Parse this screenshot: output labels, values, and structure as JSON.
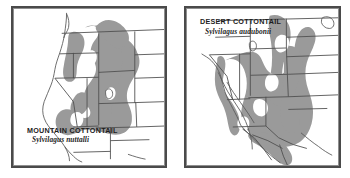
{
  "figure": {
    "background_color": "#ffffff",
    "frame_color": "#4a4a4a",
    "range_shading_color": "#9a9a9a",
    "boundary_line_color": "#4f4f4f",
    "coastline_color": "#6b6b6b"
  },
  "panels": [
    {
      "id": "mountain-cottontail",
      "common_name": "MOUNTAIN COTTONTAIL",
      "scientific_name": "Sylvilagus nuttalli",
      "label_position": "bottom-left",
      "region": "Western United States, Great Basin and Rocky Mountains",
      "range_shading_color": "#9a9a9a"
    },
    {
      "id": "desert-cottontail",
      "common_name": "DESERT COTTONTAIL",
      "scientific_name": "Sylvilagus audubonii",
      "label_position": "top-left",
      "region": "Southwestern United States and northern Mexico",
      "range_shading_color": "#9a9a9a"
    }
  ]
}
